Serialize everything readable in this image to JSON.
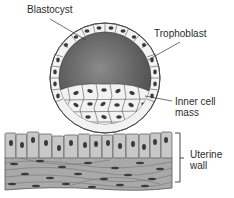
{
  "diagram": {
    "labels": {
      "blastocyst": "Blastocyst",
      "trophoblast": "Trophoblast",
      "inner_cell_mass_line1": "Inner cell",
      "inner_cell_mass_line2": "mass",
      "uterine_wall_line1": "Uterine",
      "uterine_wall_line2": "wall"
    },
    "colors": {
      "cavity": "#6e6e6e",
      "cell_fill": "#f2f2f2",
      "nucleus": "#3a3a3a",
      "epithelium": "#c8c8c8",
      "stroma": "#a9a9a9",
      "outline": "#444444"
    }
  }
}
